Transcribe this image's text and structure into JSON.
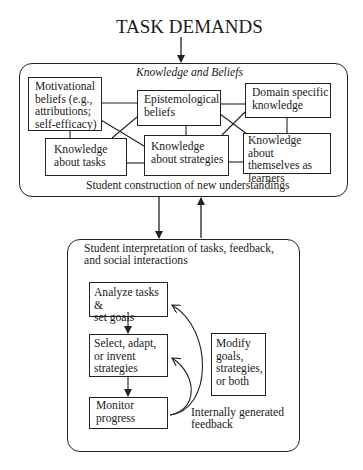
{
  "title": "TASK DEMANDS",
  "knowledge_panel": {
    "heading": "Knowledge and Beliefs",
    "footer": "Student construction of new understandings",
    "boxes": [
      {
        "id": "motivational",
        "label": "Motivational\nbeliefs (e.g.,\nattributions;\nself-efficacy)"
      },
      {
        "id": "epistemological",
        "label": "Epistemological\nbeliefs"
      },
      {
        "id": "domain",
        "label": "Domain specific\nknowledge"
      },
      {
        "id": "tasks",
        "label": "Knowledge\nabout tasks"
      },
      {
        "id": "strategies",
        "label": "Knowledge\nabout strategies"
      },
      {
        "id": "learners",
        "label": "Knowledge about\nthemselves as\nlearners"
      }
    ]
  },
  "interpretation_panel": {
    "heading": "Student interpretation of tasks, feedback,\nand social interactions",
    "steps": [
      {
        "id": "analyze",
        "label": "Analyze tasks &\nset goals"
      },
      {
        "id": "select",
        "label": "Select, adapt,\nor invent\nstrategies"
      },
      {
        "id": "monitor",
        "label": "Monitor\nprogress"
      }
    ],
    "modify": "Modify\ngoals,\nstrategies,\nor both",
    "feedback": "Internally generated\nfeedback"
  },
  "colors": {
    "line": "#222222",
    "background": "#ffffff"
  }
}
